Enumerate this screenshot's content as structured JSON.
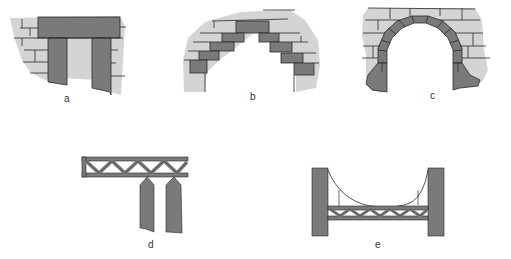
{
  "colors": {
    "background": "#ffffff",
    "wall_light": "#d4d4d4",
    "stone_dark": "#7a7a7a",
    "stone_mid": "#c8c8c8",
    "line": "#2a2a2a"
  },
  "figures": [
    {
      "id": "a",
      "label": "a",
      "depicts": "post-and-lintel opening in masonry wall"
    },
    {
      "id": "b",
      "label": "b",
      "depicts": "corbelled arch"
    },
    {
      "id": "c",
      "label": "c",
      "depicts": "true (voussoir) arch"
    },
    {
      "id": "d",
      "label": "d",
      "depicts": "cantilever truss on two piers"
    },
    {
      "id": "e",
      "label": "e",
      "depicts": "suspension span with truss deck between towers"
    }
  ]
}
